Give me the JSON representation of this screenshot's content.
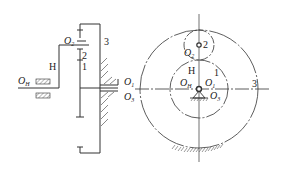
{
  "figure": {
    "type": "planetary-gear-train-diagram",
    "left_view": {
      "labels": {
        "o2": "O",
        "o2_sub": "2",
        "gear2": "2",
        "gear1": "1",
        "carrier": "H",
        "ring": "3",
        "oh": "O",
        "oh_sub": "H",
        "o1": "O",
        "o1_sub": "1",
        "o3": "O",
        "o3_sub": "3"
      }
    },
    "right_view": {
      "labels": {
        "gear2": "2",
        "o2": "O",
        "o2_sub": "2",
        "carrier": "H",
        "gear1": "1",
        "oh": "O",
        "oh_sub": "H",
        "o1": "O",
        "o1_sub": "1",
        "ring": "3",
        "o3": "O",
        "o3_sub": "3"
      }
    },
    "colors": {
      "line": "#333333",
      "hatch": "#555555",
      "background": "#ffffff"
    }
  }
}
